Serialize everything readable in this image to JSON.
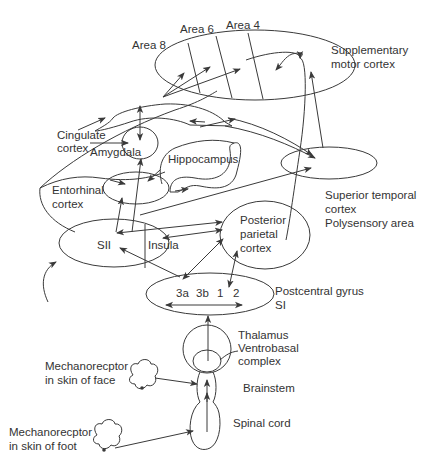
{
  "figure": {
    "type": "neuroanatomy-pathway-diagram",
    "line_color": "#3a3a3a",
    "text_color": "#333333",
    "background": "#ffffff"
  },
  "labels": {
    "area8": "Area 8",
    "area6": "Area 6",
    "area4": "Area 4",
    "sma_line1": "Supplementary",
    "sma_line2": "motor cortex",
    "cingulate_line1": "Cingulate",
    "cingulate_line2": "cortex",
    "amygdala": "Amygdala",
    "hippocampus": "Hippocampus",
    "entorhinal_line1": "Entorhinal",
    "entorhinal_line2": "cortex",
    "stc_line1": "Superior temporal",
    "stc_line2": "cortex",
    "stc_line3": "Polysensory area",
    "sii": "SII",
    "insula": "Insula",
    "ppc_line1": "Posterior",
    "ppc_line2": "parietal",
    "ppc_line3": "cortex",
    "si_area_3a": "3a",
    "si_area_3b": "3b",
    "si_area_1": "1",
    "si_area_2": "2",
    "postcentral_line1": "Postcentral gyrus",
    "postcentral_line2": "SI",
    "thalamus_line1": "Thalamus",
    "thalamus_line2": "Ventrobasal",
    "thalamus_line3": "complex",
    "brainstem": "Brainstem",
    "spinal_cord": "Spinal cord",
    "face_receptor_line1": "Mechanorecptor",
    "face_receptor_line2": "in skin of face",
    "foot_receptor_line1": "Mechanorecptor",
    "foot_receptor_line2": "in skin of foot"
  }
}
